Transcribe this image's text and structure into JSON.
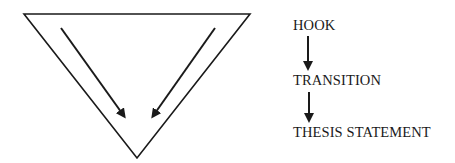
{
  "diagram": {
    "type": "funnel-flow",
    "colors": {
      "stroke": "#1a1a1a",
      "background": "#ffffff"
    },
    "funnel": {
      "shape": "inverted-triangle",
      "arrows": [
        "left-inward-down",
        "right-inward-down"
      ]
    },
    "steps": [
      {
        "label": "HOOK"
      },
      {
        "label": "TRANSITION"
      },
      {
        "label": "THESIS STATEMENT"
      }
    ]
  }
}
